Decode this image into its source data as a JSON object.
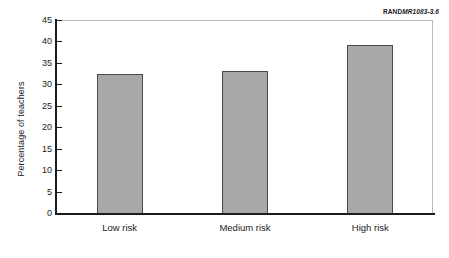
{
  "credit": {
    "brand": "RAND",
    "id": "MR1083-3.6"
  },
  "chart_data": {
    "type": "bar",
    "title": "",
    "xlabel": "",
    "ylabel": "Percentage of teachers",
    "categories": [
      "Low risk",
      "Medium risk",
      "High risk"
    ],
    "values": [
      32.5,
      33.1,
      39.1
    ],
    "ylim": [
      0,
      45
    ],
    "ytick_step": 5,
    "ytick_labels": [
      "0",
      "5",
      "10",
      "15",
      "20",
      "25",
      "30",
      "35",
      "40",
      "45"
    ],
    "ytick_values": [
      0,
      5,
      10,
      15,
      20,
      25,
      30,
      35,
      40,
      45
    ],
    "grid": false,
    "legend": null,
    "bar_color": "#a8a8a8",
    "bar_edge_color": "#4a4a4a",
    "axis_color": "#1c1c1c",
    "frame_color": "#b9b9b9",
    "background": "#ffffff"
  }
}
